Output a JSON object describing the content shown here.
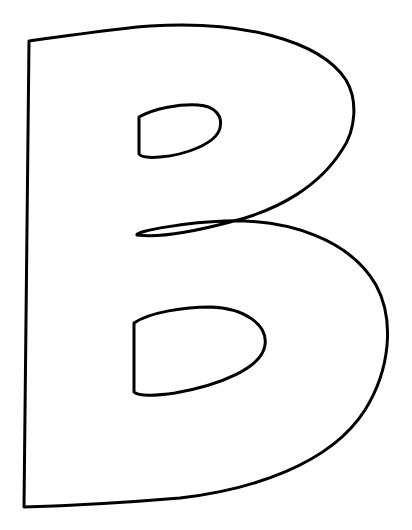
{
  "image": {
    "subject": "Outlined letter B (coloring page)",
    "letter": "B",
    "width": 412,
    "height": 530
  },
  "style": {
    "background": "#ffffff",
    "stroke_color": "#000000",
    "stroke_width": 3
  },
  "shapes": {
    "outer_outline": "outline of letter B",
    "upper_counter": "upper bowl hole",
    "lower_counter": "lower bowl hole",
    "middle_loop": "crossover loop at waist"
  }
}
